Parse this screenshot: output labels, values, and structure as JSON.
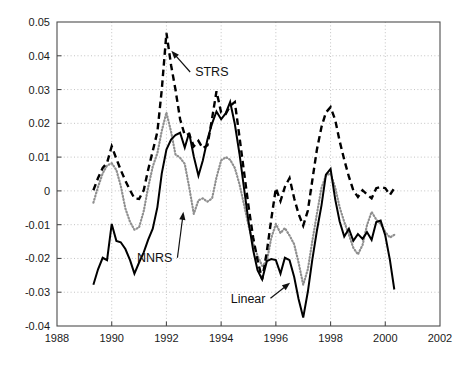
{
  "chart_data": {
    "type": "line",
    "title": "",
    "xlabel": "",
    "ylabel": "",
    "xlim": [
      1988,
      2002
    ],
    "ylim": [
      -0.04,
      0.05
    ],
    "grid": true,
    "legend_position": "inline-annotations",
    "xticks": [
      "1988",
      "1990",
      "1992",
      "1994",
      "1996",
      "1998",
      "2000",
      "2002"
    ],
    "xtick_values": [
      1988,
      1990,
      1992,
      1994,
      1996,
      1998,
      2000,
      2002
    ],
    "yticks": [
      "0.05",
      "0.04",
      "0.03",
      "0.02",
      "0.01",
      "0",
      "-0.01",
      "-0.02",
      "-0.03",
      "-0.04"
    ],
    "ytick_values": [
      0.05,
      0.04,
      0.03,
      0.02,
      0.01,
      0,
      -0.01,
      -0.02,
      -0.03,
      -0.04
    ],
    "annotations": [
      {
        "text": "STRS",
        "label_x": 1993.05,
        "label_y": 0.0352,
        "tip_x": 1992.18,
        "tip_y": 0.0415
      },
      {
        "text": "NNRS",
        "label_x": 1992.22,
        "label_y": -0.0198,
        "tip_x": 1992.62,
        "tip_y": -0.0062
      },
      {
        "text": "Linear",
        "label_x": 1995.62,
        "label_y": -0.0318,
        "tip_x": 1996.52,
        "tip_y": -0.0272
      }
    ],
    "series": [
      {
        "name": "STRS",
        "style": "dashed",
        "color": "#000000",
        "x": [
          1989.33,
          1989.5,
          1989.67,
          1989.83,
          1990.0,
          1990.17,
          1990.33,
          1990.5,
          1990.67,
          1990.83,
          1991.0,
          1991.17,
          1991.33,
          1991.5,
          1991.67,
          1991.83,
          1992.0,
          1992.17,
          1992.33,
          1992.5,
          1992.67,
          1992.83,
          1993.0,
          1993.17,
          1993.33,
          1993.5,
          1993.67,
          1993.83,
          1994.0,
          1994.17,
          1994.33,
          1994.5,
          1994.67,
          1994.83,
          1995.0,
          1995.17,
          1995.33,
          1995.5,
          1995.67,
          1995.83,
          1996.0,
          1996.17,
          1996.33,
          1996.5,
          1996.67,
          1996.83,
          1997.0,
          1997.17,
          1997.33,
          1997.5,
          1997.67,
          1997.83,
          1998.0,
          1998.17,
          1998.33,
          1998.5,
          1998.67,
          1998.83,
          1999.0,
          1999.17,
          1999.33,
          1999.5,
          1999.67,
          1999.83,
          2000.0,
          2000.17,
          2000.33
        ],
        "y": [
          0.0002,
          0.0038,
          0.0068,
          0.0083,
          0.0132,
          0.0095,
          0.0062,
          0.003,
          0.0002,
          -0.0022,
          -0.0024,
          0.0002,
          0.0062,
          0.0118,
          0.0175,
          0.03,
          0.0468,
          0.0372,
          0.03,
          0.0212,
          0.0165,
          0.0168,
          0.0132,
          0.0148,
          0.0126,
          0.0135,
          0.0215,
          0.0295,
          0.0232,
          0.0228,
          0.0252,
          0.0263,
          0.016,
          0.006,
          -0.0045,
          -0.0138,
          -0.0205,
          -0.0262,
          -0.018,
          -0.0085,
          0.0008,
          -0.003,
          0.0012,
          0.0038,
          -0.0022,
          -0.0068,
          -0.0103,
          -0.0058,
          0.003,
          0.0122,
          0.019,
          0.0232,
          0.0248,
          0.021,
          0.0148,
          0.0092,
          0.0042,
          0.0002,
          -0.0018,
          0.0002,
          -0.001,
          -0.0022,
          0.0008,
          0.0012,
          0.0008,
          -0.0012,
          0.0008
        ]
      },
      {
        "name": "NNRS",
        "style": "dotted",
        "color": "#8f8f8f",
        "x": [
          1989.33,
          1989.5,
          1989.67,
          1989.83,
          1990.0,
          1990.17,
          1990.33,
          1990.5,
          1990.67,
          1990.83,
          1991.0,
          1991.17,
          1991.33,
          1991.5,
          1991.67,
          1991.83,
          1992.0,
          1992.17,
          1992.33,
          1992.5,
          1992.67,
          1992.83,
          1993.0,
          1993.17,
          1993.33,
          1993.5,
          1993.67,
          1993.83,
          1994.0,
          1994.17,
          1994.33,
          1994.5,
          1994.67,
          1994.83,
          1995.0,
          1995.17,
          1995.33,
          1995.5,
          1995.67,
          1995.83,
          1996.0,
          1996.17,
          1996.33,
          1996.5,
          1996.67,
          1996.83,
          1997.0,
          1997.17,
          1997.33,
          1997.5,
          1997.67,
          1997.83,
          1998.0,
          1998.17,
          1998.33,
          1998.5,
          1998.67,
          1998.83,
          1999.0,
          1999.17,
          1999.33,
          1999.5,
          1999.67,
          1999.83,
          2000.0,
          2000.17,
          2000.33
        ],
        "y": [
          -0.0035,
          0.0012,
          0.0052,
          0.0075,
          0.0082,
          0.0062,
          0.0015,
          -0.0052,
          -0.0092,
          -0.0115,
          -0.0108,
          -0.006,
          0.001,
          0.0072,
          0.0112,
          0.0178,
          0.0232,
          0.0175,
          0.0108,
          0.0098,
          0.008,
          0.0012,
          -0.0068,
          -0.0028,
          -0.0022,
          -0.0032,
          -0.0022,
          0.004,
          0.009,
          0.01,
          0.0092,
          0.0068,
          0.002,
          -0.0038,
          -0.0102,
          -0.0155,
          -0.0192,
          -0.0222,
          -0.0208,
          -0.014,
          -0.0098,
          -0.0125,
          -0.011,
          -0.0132,
          -0.0158,
          -0.0212,
          -0.0278,
          -0.0232,
          -0.015,
          -0.0068,
          0.001,
          0.0045,
          0.0052,
          0.001,
          -0.0048,
          -0.0092,
          -0.013,
          -0.0168,
          -0.0188,
          -0.016,
          -0.0102,
          -0.0062,
          -0.0085,
          -0.0098,
          -0.0122,
          -0.0138,
          -0.013
        ]
      },
      {
        "name": "Linear",
        "style": "solid",
        "color": "#000000",
        "x": [
          1989.33,
          1989.5,
          1989.67,
          1989.83,
          1990.0,
          1990.17,
          1990.33,
          1990.5,
          1990.67,
          1990.83,
          1991.0,
          1991.17,
          1991.33,
          1991.5,
          1991.67,
          1991.83,
          1992.0,
          1992.17,
          1992.33,
          1992.5,
          1992.67,
          1992.83,
          1993.0,
          1993.17,
          1993.33,
          1993.5,
          1993.67,
          1993.83,
          1994.0,
          1994.17,
          1994.33,
          1994.5,
          1994.67,
          1994.83,
          1995.0,
          1995.17,
          1995.33,
          1995.5,
          1995.67,
          1995.83,
          1996.0,
          1996.17,
          1996.33,
          1996.5,
          1996.67,
          1996.83,
          1997.0,
          1997.17,
          1997.33,
          1997.5,
          1997.67,
          1997.83,
          1998.0,
          1998.17,
          1998.33,
          1998.5,
          1998.67,
          1998.83,
          1999.0,
          1999.17,
          1999.33,
          1999.5,
          1999.67,
          1999.83,
          2000.0,
          2000.17,
          2000.33
        ],
        "y": [
          -0.0278,
          -0.0232,
          -0.0198,
          -0.0205,
          -0.0098,
          -0.0148,
          -0.0152,
          -0.0172,
          -0.0205,
          -0.0245,
          -0.0212,
          -0.0182,
          -0.0145,
          -0.0112,
          -0.0048,
          0.0052,
          0.0122,
          0.0152,
          0.0165,
          0.0172,
          0.0128,
          0.0172,
          0.0102,
          0.0045,
          0.009,
          0.0152,
          0.02,
          0.0235,
          0.0212,
          0.023,
          0.0263,
          0.0198,
          0.011,
          0.0012,
          -0.009,
          -0.0175,
          -0.0235,
          -0.0262,
          -0.0208,
          -0.0202,
          -0.0205,
          -0.0245,
          -0.0198,
          -0.0205,
          -0.0255,
          -0.032,
          -0.0375,
          -0.0298,
          -0.0205,
          -0.0118,
          -0.0042,
          0.0048,
          0.0065,
          -0.0025,
          -0.009,
          -0.0135,
          -0.0112,
          -0.0148,
          -0.0128,
          -0.0142,
          -0.0122,
          -0.0145,
          -0.0092,
          -0.0088,
          -0.0132,
          -0.0205,
          -0.0292
        ]
      }
    ]
  }
}
